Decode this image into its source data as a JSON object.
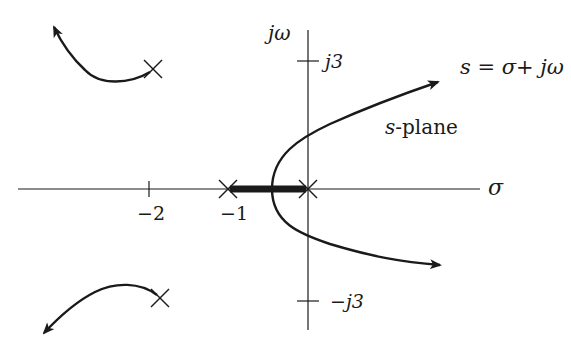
{
  "diagram": {
    "colors": {
      "ink": "#1a1a1a",
      "background": "#ffffff"
    },
    "axes": {
      "real_axis_label": "σ",
      "imag_axis_label": "jω",
      "real_ticks": [
        {
          "value": -2,
          "label": "−2"
        },
        {
          "value": -1,
          "label": "−1"
        }
      ],
      "imag_ticks": [
        {
          "value": 3,
          "label": "j3"
        },
        {
          "value": -3,
          "label": "−j3"
        }
      ]
    },
    "annotations": {
      "equation": "s = σ+ jω",
      "plane_label_s": "s",
      "plane_label_rest": "-plane"
    },
    "poles": [
      {
        "re": 0,
        "im": 0
      },
      {
        "re": -1,
        "im": 0
      },
      {
        "re": -2,
        "im": 3
      },
      {
        "re": -2,
        "im": -3
      }
    ],
    "branches": [
      {
        "name": "real-axis-segment",
        "from": "-1",
        "to": "0",
        "style": "thick"
      },
      {
        "name": "upper-right-branch",
        "start": "breakaway ≈ -0.45",
        "direction": "toward upper right asymptote"
      },
      {
        "name": "lower-right-branch",
        "start": "breakaway ≈ -0.45",
        "direction": "toward lower right asymptote"
      },
      {
        "name": "upper-left-branch",
        "start": "pole -2+j3",
        "direction": "toward upper left"
      },
      {
        "name": "lower-left-branch",
        "start": "pole -2-j3",
        "direction": "toward lower left"
      }
    ]
  }
}
